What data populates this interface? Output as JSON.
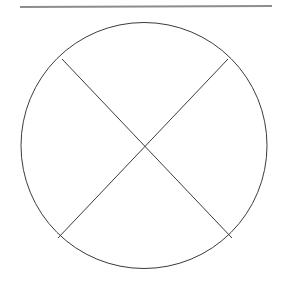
{
  "canvas": {
    "width": 287,
    "height": 290,
    "background_color": "#ffffff"
  },
  "figure": {
    "title": ""
  },
  "elements": {
    "top_rule": {
      "name": "horizontal-rule",
      "x1": 20,
      "y1": 7,
      "x2": 272,
      "y2": 6,
      "stroke_color": "#8d8d8d",
      "stroke_width": 1.8
    },
    "circle": {
      "name": "circle-outline",
      "cx": 144,
      "cy": 145.5,
      "r": 123,
      "stroke_color": "#3b3b3b",
      "stroke_width": 1,
      "fill": "none"
    },
    "chord_nw_se": {
      "name": "chord-northwest-southeast",
      "x1": 62,
      "y1": 59,
      "x2": 232,
      "y2": 238,
      "stroke_color": "#3b3b3b",
      "stroke_width": 1
    },
    "chord_ne_sw": {
      "name": "chord-northeast-southwest",
      "x1": 228,
      "y1": 59,
      "x2": 58,
      "y2": 238,
      "stroke_color": "#3b3b3b",
      "stroke_width": 1
    },
    "intersection": {
      "name": "chord-intersection-point",
      "x": 145,
      "y": 148
    }
  }
}
